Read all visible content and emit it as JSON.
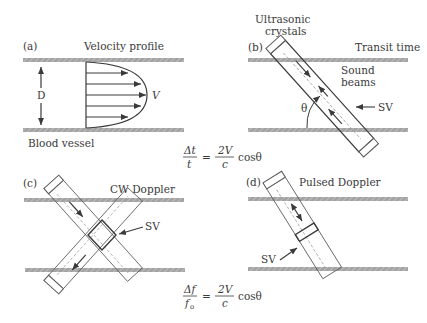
{
  "figure": {
    "panels": [
      {
        "id": "a",
        "tag": "(a)",
        "title": "Velocity profile",
        "labels": {
          "diameter": "D",
          "velocity": "V",
          "vessel": "Blood vessel"
        }
      },
      {
        "id": "b",
        "tag": "(b)",
        "title": "Transit time",
        "labels": {
          "crystals_line1": "Ultrasonic",
          "crystals_line2": "crystals",
          "beams_line1": "Sound",
          "beams_line2": "beams",
          "sample_volume": "SV",
          "angle": "θ"
        }
      },
      {
        "id": "c",
        "tag": "(c)",
        "title": "CW Doppler",
        "labels": {
          "sample_volume": "SV"
        }
      },
      {
        "id": "d",
        "tag": "(d)",
        "title": "Pulsed Doppler",
        "labels": {
          "sample_volume": "SV"
        }
      }
    ],
    "equations": [
      {
        "id": "transit-time-equation",
        "lhs_num": "Δt",
        "lhs_den": "t",
        "equals": "=",
        "rhs_num": "2V",
        "rhs_den": "c",
        "rhs_tail": "cosθ"
      },
      {
        "id": "doppler-equation",
        "lhs_num": "Δf",
        "lhs_den": "f",
        "lhs_den_sub": "o",
        "equals": "=",
        "rhs_num": "2V",
        "rhs_den": "c",
        "rhs_tail": "cosθ"
      }
    ],
    "colors": {
      "line": "#3a3a3a",
      "wall": "#9a9a9a",
      "wall_hatch": "#bdbdbd",
      "beam_dash": "#9a9a9a"
    }
  }
}
